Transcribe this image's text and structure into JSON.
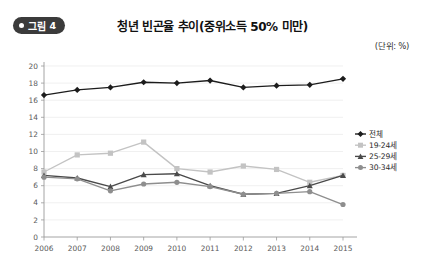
{
  "figure": {
    "badge_label": "그림",
    "badge_number": "4",
    "title": "청년 빈곤율 추이(중위소득 50% 미만)",
    "unit_note": "(단위: %)"
  },
  "chart_data": {
    "type": "line",
    "title": "청년 빈곤율 추이(중위소득 50% 미만)",
    "xlabel": "",
    "ylabel": "",
    "unit": "%",
    "ylim": [
      0,
      20
    ],
    "ytick_step": 2,
    "yticks": [
      "0",
      "2",
      "4",
      "6",
      "8",
      "10",
      "12",
      "14",
      "16",
      "18",
      "20"
    ],
    "grid": true,
    "legend_position": "right",
    "categories": [
      "2006",
      "2007",
      "2008",
      "2009",
      "2010",
      "2011",
      "2012",
      "2013",
      "2014",
      "2015"
    ],
    "series": [
      {
        "name": "전체",
        "color": "#1c1c1c",
        "marker": "diamond",
        "values": [
          16.6,
          17.2,
          17.5,
          18.1,
          18.0,
          18.3,
          17.5,
          17.7,
          17.8,
          18.5
        ]
      },
      {
        "name": "19-24세",
        "color": "#c3c3c3",
        "marker": "square",
        "values": [
          7.6,
          9.6,
          9.8,
          11.1,
          8.0,
          7.6,
          8.3,
          7.9,
          6.4,
          7.2
        ]
      },
      {
        "name": "25-29세",
        "color": "#4a4a4a",
        "marker": "triangle",
        "values": [
          7.2,
          6.9,
          5.9,
          7.3,
          7.4,
          6.0,
          5.0,
          5.1,
          6.0,
          7.2
        ]
      },
      {
        "name": "30-34세",
        "color": "#8e8e8e",
        "marker": "circle",
        "values": [
          7.0,
          6.8,
          5.4,
          6.2,
          6.4,
          5.9,
          5.0,
          5.1,
          5.3,
          3.8
        ]
      }
    ]
  }
}
